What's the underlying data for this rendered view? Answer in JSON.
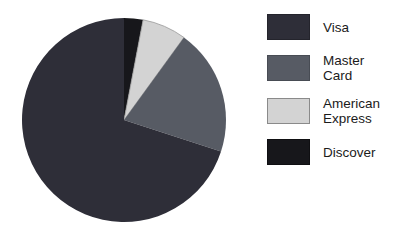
{
  "background": "#ffffff",
  "chart_data": {
    "type": "pie",
    "title": "",
    "legend_position": "right",
    "start_angle_deg_from_top": 0,
    "direction": "clockwise",
    "center": [
      124,
      120
    ],
    "radius": 102,
    "categories": [
      "Visa",
      "Master Card",
      "American Express",
      "Discover"
    ],
    "values_pct": [
      70,
      20,
      7,
      3
    ],
    "slices_draw_order": [
      {
        "name": "Discover",
        "pct": 3,
        "color": "#17171b",
        "stroke": null
      },
      {
        "name": "American Express",
        "pct": 7,
        "color": "#d3d3d3",
        "stroke": "#999999"
      },
      {
        "name": "Master Card",
        "pct": 20,
        "color": "#575b64",
        "stroke": null
      },
      {
        "name": "Visa",
        "pct": 70,
        "color": "#2e2e38",
        "stroke": null
      }
    ]
  },
  "legend": {
    "items": [
      {
        "label": "Visa",
        "color": "#2e2e38",
        "border": "#24242c"
      },
      {
        "label": "Master Card",
        "color": "#575b64",
        "border": "#484c54"
      },
      {
        "label": "American Express",
        "color": "#d3d3d3",
        "border": "#8a8a8a"
      },
      {
        "label": "Discover",
        "color": "#17171b",
        "border": "#0f0f12"
      }
    ]
  }
}
